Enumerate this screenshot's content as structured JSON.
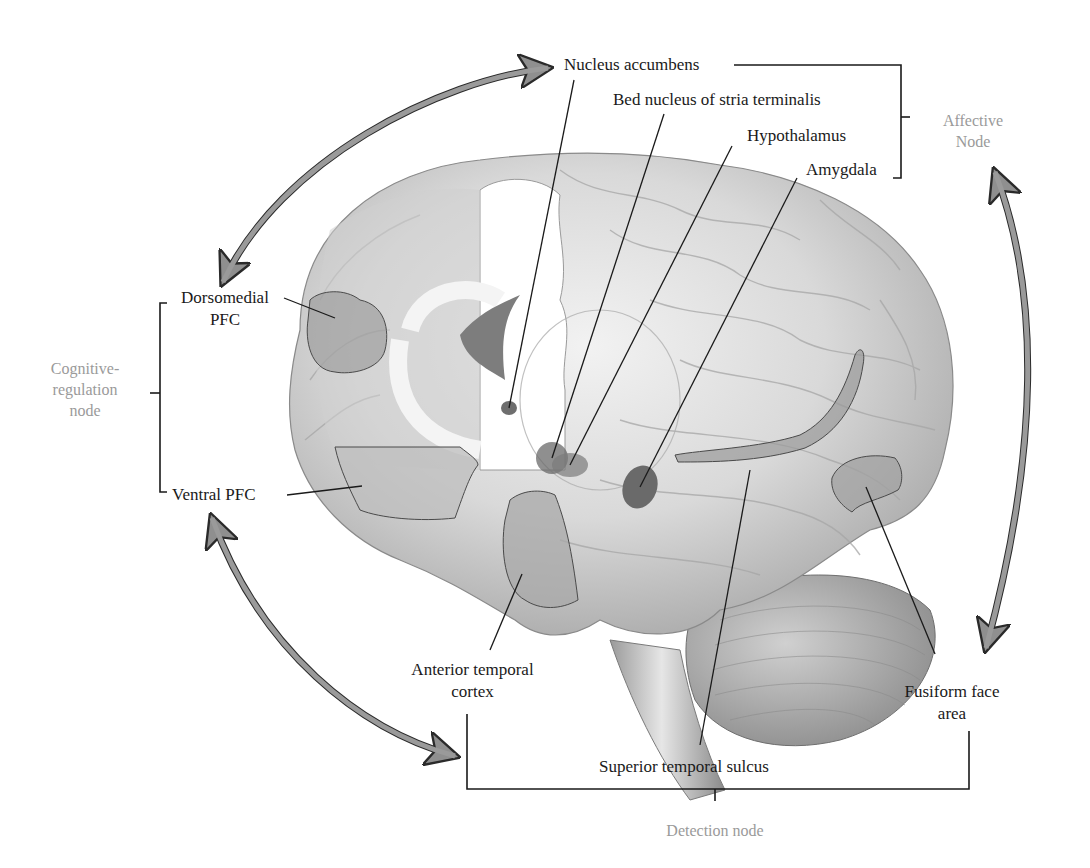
{
  "diagram": {
    "title": "",
    "nodes": {
      "affective": {
        "label_line1": "Affective",
        "label_line2": "Node"
      },
      "cognitive": {
        "label_line1": "Cognitive-",
        "label_line2": "regulation",
        "label_line3": "node"
      },
      "detection": {
        "label": "Detection node"
      }
    },
    "structures": {
      "nucleus_accumbens": "Nucleus accumbens",
      "bnst": "Bed nucleus of stria terminalis",
      "hypothalamus": "Hypothalamus",
      "amygdala": "Amygdala",
      "dmpfc_line1": "Dorsomedial",
      "dmpfc_line2": "PFC",
      "vpfc": "Ventral PFC",
      "atc_line1": "Anterior temporal",
      "atc_line2": "cortex",
      "sts": "Superior temporal sulcus",
      "ffa_line1": "Fusiform face",
      "ffa_line2": "area"
    },
    "groupings": [
      {
        "node": "Affective Node",
        "members": [
          "Nucleus accumbens",
          "Bed nucleus of stria terminalis",
          "Hypothalamus",
          "Amygdala"
        ]
      },
      {
        "node": "Cognitive-regulation node",
        "members": [
          "Dorsomedial PFC",
          "Ventral PFC"
        ]
      },
      {
        "node": "Detection node",
        "members": [
          "Anterior temporal cortex",
          "Superior temporal sulcus",
          "Fusiform face area"
        ]
      }
    ],
    "arrows": [
      {
        "from": "Cognitive-regulation node",
        "to": "Affective Node",
        "bidirectional": true
      },
      {
        "from": "Affective Node",
        "to": "Detection node",
        "bidirectional": true
      },
      {
        "from": "Detection node",
        "to": "Cognitive-regulation node",
        "bidirectional": true
      }
    ],
    "colors": {
      "arrow_fill": "#9a9a9a",
      "arrow_edge": "#2a2a2a",
      "node_text": "#9a9a9a",
      "label_text": "#1a1a1a",
      "brain_base": "#d4d4d4",
      "region_highlight": "#8c8c8c"
    }
  }
}
